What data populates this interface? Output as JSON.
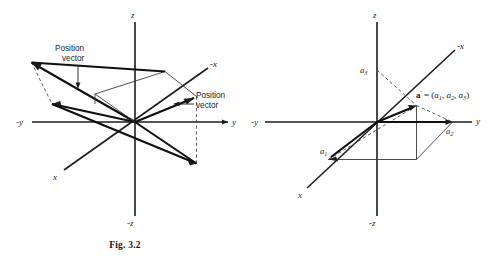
{
  "document": {
    "kind": "textbook-figure-pair",
    "background_color": "#ffffff",
    "line_color": "#1d1d1d"
  },
  "figures": [
    {
      "id": "fig-3-2",
      "caption": "Fig. 3.2",
      "axis_labels": {
        "z": "z",
        "neg_z": "-z",
        "y": "y",
        "neg_y": "-y",
        "x": "x",
        "neg_x": "-x"
      },
      "annotations": [
        {
          "id": "position-vector-upper",
          "line1": "Position",
          "line2": "vector"
        },
        {
          "id": "position-vector-lower",
          "line1": "Position",
          "line2": "vector"
        }
      ]
    },
    {
      "id": "fig-3-3",
      "caption": "Fig. 3.3",
      "axis_labels": {
        "z": "z",
        "neg_z": "-z",
        "y": "y",
        "neg_y": "-y",
        "x": "x",
        "neg_x": "-x"
      },
      "component_labels": {
        "a1_base": "a",
        "a1_sub": "1",
        "a2_base": "a",
        "a2_sub": "2",
        "a3_base": "a",
        "a3_sub": "3"
      },
      "formula": {
        "vector_symbol": "a",
        "prime": "'",
        "equals": " = (",
        "comp1_base": "a",
        "comp1_sub": "1",
        "sep1": ", ",
        "comp2_base": "a",
        "comp2_sub": "2",
        "sep2": ", ",
        "comp3_base": "a",
        "comp3_sub": "3",
        "close": ")"
      }
    }
  ]
}
